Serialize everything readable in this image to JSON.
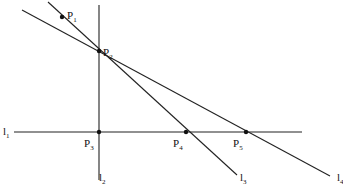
{
  "diagram": {
    "title": "",
    "line_color": "#222222",
    "points": [
      {
        "id": "P1",
        "label": "P",
        "sub": "1",
        "x": 62,
        "y": 17,
        "lx": 67,
        "ly": 19
      },
      {
        "id": "P2",
        "label": "P",
        "sub": "2",
        "x": 99,
        "y": 51,
        "lx": 103,
        "ly": 56
      },
      {
        "id": "P3",
        "label": "P",
        "sub": "3",
        "x": 99,
        "y": 132,
        "lx": 84,
        "ly": 147
      },
      {
        "id": "P4",
        "label": "P",
        "sub": "4",
        "x": 186,
        "y": 132,
        "lx": 173,
        "ly": 147
      },
      {
        "id": "P5",
        "label": "P",
        "sub": "5",
        "x": 246,
        "y": 132,
        "lx": 233,
        "ly": 147
      }
    ],
    "lines": [
      {
        "id": "l1",
        "label": "l",
        "sub": "1",
        "x1": 14,
        "y1": 132,
        "x2": 302,
        "y2": 132,
        "lx": 3,
        "ly": 135
      },
      {
        "id": "l2",
        "label": "l",
        "sub": "2",
        "x1": 99,
        "y1": 5,
        "x2": 99,
        "y2": 180,
        "lx": 99,
        "ly": 181
      },
      {
        "id": "l3",
        "label": "l",
        "sub": "3",
        "x1": 48,
        "y1": 2,
        "x2": 237,
        "y2": 175,
        "lx": 240,
        "ly": 181
      },
      {
        "id": "l4",
        "label": "l",
        "sub": "4",
        "x1": 22,
        "y1": 10,
        "x2": 330,
        "y2": 176,
        "lx": 337,
        "ly": 181
      }
    ]
  }
}
